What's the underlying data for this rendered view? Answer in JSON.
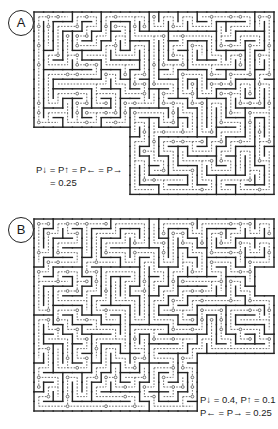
{
  "figure": {
    "panels": [
      {
        "id": "A",
        "label": "A",
        "caption_line1": "P↓ = P↑ = P← = P→",
        "caption_line2": "= 0.25",
        "probabilities": {
          "down": 0.25,
          "up": 0.25,
          "left": 0.25,
          "right": 0.25
        },
        "grid": {
          "x": 34,
          "y": 12,
          "cols": 25,
          "rows": 19,
          "cell": 9.6,
          "seed": 7
        },
        "cutout": {
          "bottom_left_cols": 10,
          "bottom_left_rows": 7,
          "top_left_cols": 3,
          "top_left_rows": 3
        }
      },
      {
        "id": "B",
        "label": "B",
        "caption_line1": "P↓ = 0.4, P↑ = 0.1",
        "caption_line2": "P← = P→ = 0.25",
        "probabilities": {
          "down": 0.4,
          "up": 0.1,
          "left": 0.25,
          "right": 0.25
        },
        "grid": {
          "x": 34,
          "y": 4,
          "cols": 25,
          "rows": 20,
          "cell": 9.6,
          "seed": 19
        },
        "cutout": {
          "bottom_right_cols": 8,
          "bottom_right_rows": 6,
          "top_right_cols": 2,
          "top_right_rows": 5
        }
      }
    ],
    "colors": {
      "wall": "#222222",
      "path": "#333333",
      "node": "#444444",
      "background": "#ffffff"
    }
  }
}
